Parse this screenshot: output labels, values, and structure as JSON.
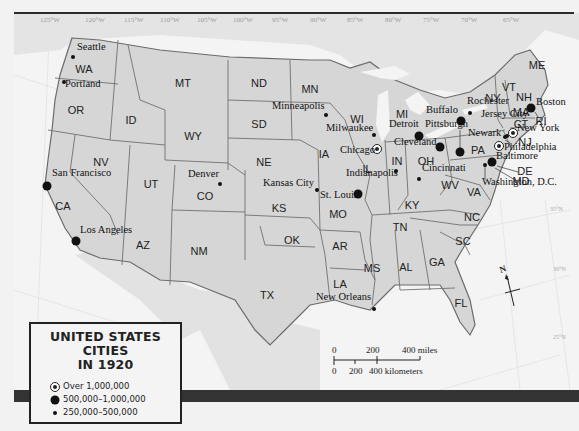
{
  "title": {
    "line1": "UNITED STATES CITIES",
    "line2": "IN 1920"
  },
  "legend": {
    "items": [
      {
        "symbol": "large-ring-dot",
        "label": "Over 1,000,000"
      },
      {
        "symbol": "medium-dot",
        "label": "500,000–1,000,000"
      },
      {
        "symbol": "small-dot",
        "label": "250,000–500,000"
      }
    ]
  },
  "longitudes": [
    "125°W",
    "120°W",
    "115°W",
    "110°W",
    "105°W",
    "100°W",
    "95°W",
    "90°W",
    "85°W",
    "80°W",
    "75°W",
    "70°W",
    "65°W"
  ],
  "latitudes": [
    "35°N",
    "30°N",
    "25°N"
  ],
  "states": [
    {
      "abbr": "WA",
      "x": 84,
      "y": 69
    },
    {
      "abbr": "OR",
      "x": 76,
      "y": 110
    },
    {
      "abbr": "CA",
      "x": 63,
      "y": 206
    },
    {
      "abbr": "ID",
      "x": 131,
      "y": 120
    },
    {
      "abbr": "NV",
      "x": 101,
      "y": 162
    },
    {
      "abbr": "MT",
      "x": 183,
      "y": 83
    },
    {
      "abbr": "WY",
      "x": 193,
      "y": 136
    },
    {
      "abbr": "UT",
      "x": 151,
      "y": 184
    },
    {
      "abbr": "AZ",
      "x": 143,
      "y": 245
    },
    {
      "abbr": "CO",
      "x": 205,
      "y": 196
    },
    {
      "abbr": "NM",
      "x": 199,
      "y": 251
    },
    {
      "abbr": "ND",
      "x": 259,
      "y": 83
    },
    {
      "abbr": "SD",
      "x": 259,
      "y": 124
    },
    {
      "abbr": "NE",
      "x": 264,
      "y": 162
    },
    {
      "abbr": "KS",
      "x": 279,
      "y": 208
    },
    {
      "abbr": "OK",
      "x": 292,
      "y": 240
    },
    {
      "abbr": "TX",
      "x": 267,
      "y": 295
    },
    {
      "abbr": "MN",
      "x": 310,
      "y": 89
    },
    {
      "abbr": "IA",
      "x": 324,
      "y": 154
    },
    {
      "abbr": "MO",
      "x": 338,
      "y": 214
    },
    {
      "abbr": "AR",
      "x": 340,
      "y": 246
    },
    {
      "abbr": "LA",
      "x": 340,
      "y": 284
    },
    {
      "abbr": "WI",
      "x": 357,
      "y": 119
    },
    {
      "abbr": "IL",
      "x": 367,
      "y": 169
    },
    {
      "abbr": "MI",
      "x": 402,
      "y": 114
    },
    {
      "abbr": "IN",
      "x": 397,
      "y": 161
    },
    {
      "abbr": "OH",
      "x": 426,
      "y": 161
    },
    {
      "abbr": "KY",
      "x": 412,
      "y": 205
    },
    {
      "abbr": "TN",
      "x": 400,
      "y": 227
    },
    {
      "abbr": "MS",
      "x": 372,
      "y": 268
    },
    {
      "abbr": "AL",
      "x": 406,
      "y": 267
    },
    {
      "abbr": "GA",
      "x": 437,
      "y": 262
    },
    {
      "abbr": "FL",
      "x": 461,
      "y": 303
    },
    {
      "abbr": "SC",
      "x": 463,
      "y": 241
    },
    {
      "abbr": "NC",
      "x": 472,
      "y": 217
    },
    {
      "abbr": "WV",
      "x": 450,
      "y": 185
    },
    {
      "abbr": "VA",
      "x": 474,
      "y": 192
    },
    {
      "abbr": "PA",
      "x": 478,
      "y": 150
    },
    {
      "abbr": "NY",
      "x": 493,
      "y": 98
    },
    {
      "abbr": "VT",
      "x": 509,
      "y": 87
    },
    {
      "abbr": "NH",
      "x": 524,
      "y": 97
    },
    {
      "abbr": "ME",
      "x": 537,
      "y": 65
    },
    {
      "abbr": "MA",
      "x": 521,
      "y": 112
    },
    {
      "abbr": "CT",
      "x": 521,
      "y": 124
    },
    {
      "abbr": "RI",
      "x": 541,
      "y": 121
    },
    {
      "abbr": "NJ",
      "x": 525,
      "y": 142
    },
    {
      "abbr": "DE",
      "x": 525,
      "y": 171
    },
    {
      "abbr": "MD",
      "x": 521,
      "y": 181
    }
  ],
  "cities": [
    {
      "name": "Seattle",
      "size": "small",
      "dx": 73,
      "dy": 57,
      "lx": 77,
      "ly": 47
    },
    {
      "name": "Portland",
      "size": "small",
      "dx": 64,
      "dy": 82,
      "lx": 65,
      "ly": 84
    },
    {
      "name": "San Francisco",
      "size": "medium",
      "dx": 47,
      "dy": 186,
      "lx": 52,
      "ly": 173
    },
    {
      "name": "Los Angeles",
      "size": "medium",
      "dx": 76,
      "dy": 241,
      "lx": 80,
      "ly": 230
    },
    {
      "name": "Denver",
      "size": "small",
      "dx": 220,
      "dy": 184,
      "lx": 188,
      "ly": 174
    },
    {
      "name": "Minneapolis",
      "size": "small",
      "dx": 326,
      "dy": 115,
      "lx": 272,
      "ly": 106
    },
    {
      "name": "Milwaukee",
      "size": "small",
      "dx": 374,
      "dy": 135,
      "lx": 326,
      "ly": 128
    },
    {
      "name": "Chicago",
      "size": "large",
      "dx": 377,
      "dy": 149,
      "lx": 340,
      "ly": 150
    },
    {
      "name": "Kansas City",
      "size": "small",
      "dx": 317,
      "dy": 190,
      "lx": 263,
      "ly": 183
    },
    {
      "name": "St. Louis",
      "size": "medium",
      "dx": 358,
      "dy": 194,
      "lx": 320,
      "ly": 195
    },
    {
      "name": "Indianapolis",
      "size": "small",
      "dx": 396,
      "dy": 171,
      "lx": 346,
      "ly": 173
    },
    {
      "name": "Detroit",
      "size": "medium",
      "dx": 419,
      "dy": 136,
      "lx": 389,
      "ly": 124
    },
    {
      "name": "Cleveland",
      "size": "medium",
      "dx": 440,
      "dy": 147,
      "lx": 394,
      "ly": 142
    },
    {
      "name": "Cincinnati",
      "size": "small",
      "dx": 419,
      "dy": 179,
      "lx": 422,
      "ly": 168
    },
    {
      "name": "Buffalo",
      "size": "medium",
      "dx": 461,
      "dy": 121,
      "lx": 426,
      "ly": 110
    },
    {
      "name": "Pittsburgh",
      "size": "medium",
      "dx": 460,
      "dy": 152,
      "lx": 425,
      "ly": 124
    },
    {
      "name": "Rochester",
      "size": "small",
      "dx": 470,
      "dy": 113,
      "lx": 467,
      "ly": 101
    },
    {
      "name": "Jersey City",
      "size": "small",
      "dx": 507,
      "dy": 136,
      "lx": 481,
      "ly": 114
    },
    {
      "name": "Newark",
      "size": "small",
      "dx": 505,
      "dy": 137,
      "lx": 468,
      "ly": 133
    },
    {
      "name": "New York",
      "size": "large",
      "dx": 513,
      "dy": 133,
      "lx": 517,
      "ly": 128
    },
    {
      "name": "Boston",
      "size": "medium",
      "dx": 531,
      "dy": 108,
      "lx": 536,
      "ly": 102
    },
    {
      "name": "Philadelphia",
      "size": "large",
      "dx": 499,
      "dy": 146,
      "lx": 504,
      "ly": 147
    },
    {
      "name": "Baltimore",
      "size": "medium",
      "dx": 492,
      "dy": 162,
      "lx": 496,
      "ly": 156
    },
    {
      "name": "Washington, D.C.",
      "size": "small",
      "dx": 485,
      "dy": 165,
      "lx": 482,
      "ly": 182
    },
    {
      "name": "New Orleans",
      "size": "small",
      "dx": 374,
      "dy": 309,
      "lx": 316,
      "ly": 297
    }
  ],
  "scale_bar": {
    "miles": {
      "ticks": [
        "0",
        "200",
        "400 miles"
      ]
    },
    "kilometers": {
      "ticks": [
        "0",
        "200",
        "400 kilometers"
      ]
    }
  },
  "compass": {
    "label": "N"
  },
  "colors": {
    "land": "#d6d6d6",
    "water": "#f4f4f4",
    "border": "#6b6b6b",
    "frame": "#2b2b2b"
  }
}
